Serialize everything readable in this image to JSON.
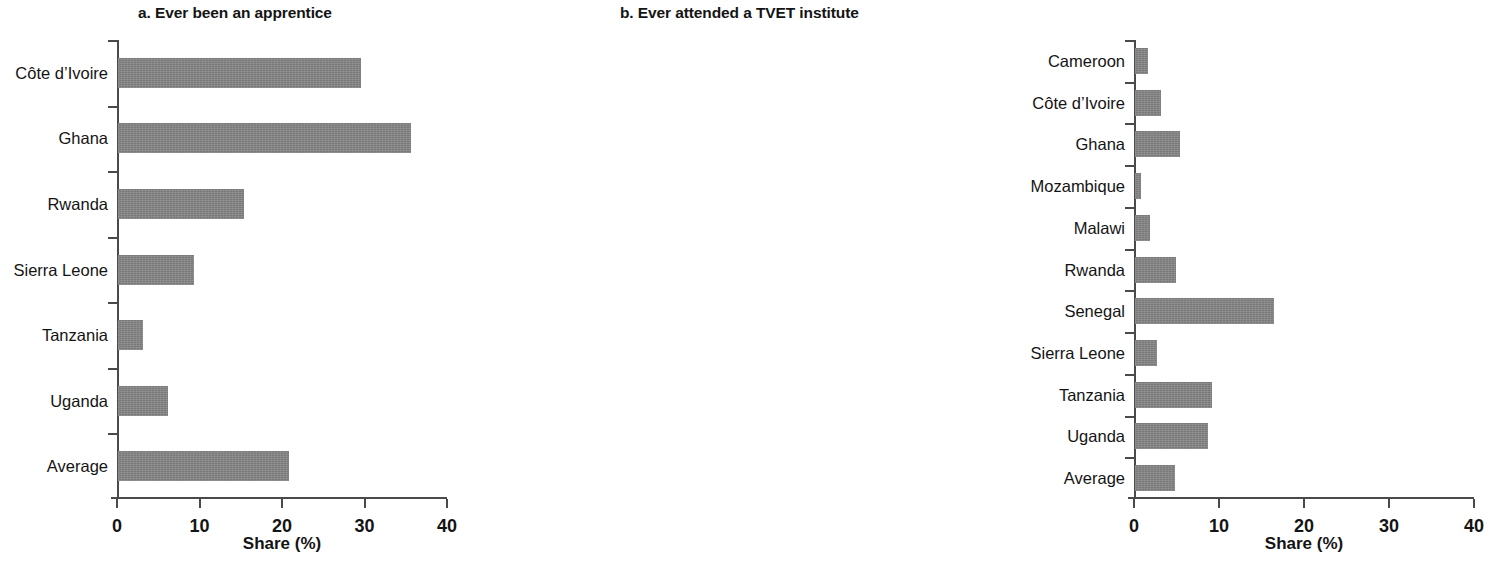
{
  "figure": {
    "background": "#ffffff",
    "bar_color": "#858585",
    "axis_color": "#4a4a4a"
  },
  "panels": [
    {
      "id": "panel-a",
      "title": "a.  Ever been an apprentice",
      "xlabel": "Share (%)",
      "xticks": [
        "0",
        "10",
        "20",
        "30",
        "40"
      ]
    },
    {
      "id": "panel-b",
      "title": "b.  Ever attended a TVET institute",
      "xlabel": "Share (%)",
      "xticks": [
        "0",
        "10",
        "20",
        "30",
        "40"
      ]
    }
  ],
  "chart_data": [
    {
      "type": "bar",
      "orientation": "horizontal",
      "title": "a.  Ever been an apprentice",
      "xlabel": "Share (%)",
      "ylabel": "",
      "xlim": [
        0,
        40
      ],
      "xticks": [
        0,
        10,
        20,
        30,
        40
      ],
      "grid": false,
      "legend": "none",
      "categories": [
        "Côte d’Ivoire",
        "Ghana",
        "Rwanda",
        "Sierra Leone",
        "Tanzania",
        "Uganda",
        "Average"
      ],
      "values": [
        29.5,
        35.5,
        15.3,
        9.2,
        3.0,
        6.0,
        20.7
      ]
    },
    {
      "type": "bar",
      "orientation": "horizontal",
      "title": "b.  Ever attended a TVET institute",
      "xlabel": "Share (%)",
      "ylabel": "",
      "xlim": [
        0,
        40
      ],
      "xticks": [
        0,
        10,
        20,
        30,
        40
      ],
      "grid": false,
      "legend": "none",
      "categories": [
        "Cameroon",
        "Côte d’Ivoire",
        "Ghana",
        "Mozambique",
        "Malawi",
        "Rwanda",
        "Senegal",
        "Sierra Leone",
        "Tanzania",
        "Uganda",
        "Average"
      ],
      "values": [
        1.5,
        3.0,
        5.3,
        0.7,
        1.8,
        4.8,
        16.3,
        2.6,
        9.1,
        8.6,
        4.7
      ]
    }
  ]
}
